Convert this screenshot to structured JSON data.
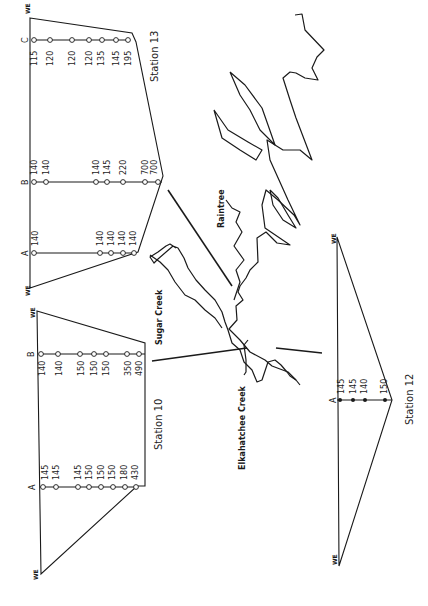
{
  "figure": {
    "orientation": "rotated 90 degrees counter-clockwise",
    "colors": {
      "ink": "#1a1a1a",
      "background": "#ffffff"
    }
  },
  "map": {
    "labels": {
      "sugar_creek": "Sugar Creek",
      "raintree": "Raintree",
      "elkahatchee_creek": "Elkahatchee Creek"
    }
  },
  "stations": [
    {
      "name": "Station 13",
      "surface_marker": "WE",
      "columns": [
        {
          "label": "A",
          "values": [
            "140",
            "140",
            "140",
            "140",
            "140"
          ]
        },
        {
          "label": "B",
          "values": [
            "140",
            "140",
            "140",
            "145",
            "220",
            "700",
            "700"
          ]
        },
        {
          "label": "C",
          "values": [
            "115",
            "120",
            "120",
            "120",
            "135",
            "145",
            "195"
          ]
        }
      ]
    },
    {
      "name": "Station 10",
      "surface_marker": "WE",
      "columns": [
        {
          "label": "A",
          "values": [
            "145",
            "145",
            "145",
            "150",
            "150",
            "150",
            "180",
            "430"
          ]
        },
        {
          "label": "B",
          "values": [
            "140",
            "140",
            "150",
            "150",
            "150",
            "350",
            "490"
          ]
        }
      ]
    },
    {
      "name": "Station 12",
      "surface_marker": "WE",
      "columns": [
        {
          "label": "A",
          "values": [
            "145",
            "145",
            "140",
            "150"
          ]
        }
      ]
    }
  ]
}
